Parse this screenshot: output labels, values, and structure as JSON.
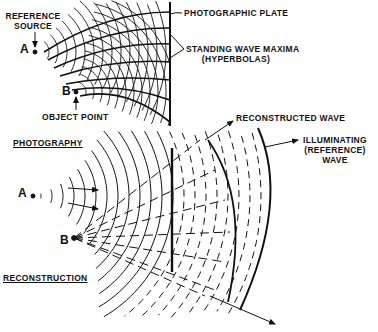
{
  "figure": {
    "ink_color": "#111111",
    "background_color": "#ffffff",
    "photography": {
      "section_label": "PHOTOGRAPHY",
      "reference_source_label_line1": "REFERENCE",
      "reference_source_label_line2": "SOURCE",
      "point_a_label": "A",
      "point_b_label": "B",
      "object_point_label": "OBJECT POINT",
      "plate_label": "PHOTOGRAPHIC PLATE",
      "maxima_label_line1": "STANDING WAVE MAXIMA",
      "maxima_label_line2": "(HYPERBOLAS)"
    },
    "reconstruction": {
      "section_label": "RECONSTRUCTION",
      "point_a_label": "A",
      "point_b_label": "B",
      "reconstructed_wave_label": "RECONSTRUCTED WAVE",
      "illuminating_label_line1": "ILLUMINATING",
      "illuminating_label_line2": "(REFERENCE)",
      "illuminating_label_line3": "WAVE"
    }
  }
}
